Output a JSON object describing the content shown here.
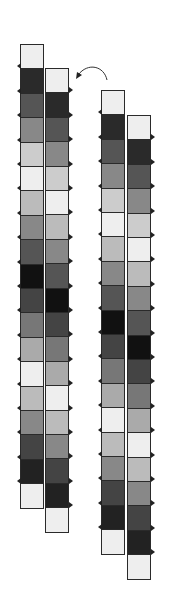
{
  "diagram": {
    "block_height": 24.4,
    "shades": [
      "#eeeeee",
      "#2a2a2a",
      "#555555",
      "#888888",
      "#cccccc",
      "#eeeeee",
      "#bbbbbb",
      "#888888",
      "#555555",
      "#111111",
      "#444444",
      "#777777",
      "#aaaaaa",
      "#eeeeee",
      "#bbbbbb",
      "#888888",
      "#444444",
      "#222222",
      "#eeeeee"
    ],
    "strips": [
      {
        "name": "strip-a-left",
        "x": 20,
        "y": 44
      },
      {
        "name": "strip-a-right",
        "x": 45,
        "y": 68
      },
      {
        "name": "strip-b-left",
        "x": 101,
        "y": 90
      },
      {
        "name": "strip-b-right",
        "x": 127,
        "y": 115
      }
    ],
    "arrow": {
      "from": "strip-b",
      "to": "strip-a",
      "description": "curved arrow"
    }
  }
}
